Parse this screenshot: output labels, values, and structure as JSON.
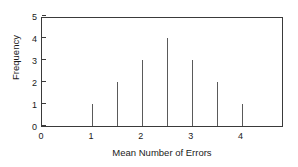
{
  "chart_data": {
    "type": "bar",
    "title": "",
    "subtitle": "",
    "xlabel": "Mean Number of Errors",
    "ylabel": "Frequency",
    "x": [
      1,
      1.5,
      2,
      2.5,
      3,
      3.5,
      4
    ],
    "values": [
      1,
      2,
      3,
      4,
      3,
      2,
      1
    ],
    "categories": [
      "1",
      "1.5",
      "2",
      "2.5",
      "3",
      "3.5",
      "4"
    ],
    "xlim": [
      0,
      4.85
    ],
    "ylim": [
      0,
      5
    ],
    "x_tick_labels": [
      "0",
      "1",
      "2",
      "3",
      "4"
    ],
    "x_tick_values": [
      0,
      1,
      2,
      3,
      4
    ],
    "x_minor_tick_values": [
      1,
      1.5,
      2,
      2.5,
      3,
      3.5,
      4
    ],
    "y_tick_labels": [
      "0",
      "1",
      "2",
      "3",
      "4",
      "5"
    ],
    "y_tick_values": [
      0,
      1,
      2,
      3,
      4,
      5
    ],
    "grid": false,
    "legend": null,
    "legend_position": "none",
    "annotations": [],
    "style": {
      "spike_color": "#5a5a5a",
      "axis_color": "#3a3a3a",
      "text_color": "#1a1a1a",
      "background": "#ffffff",
      "marker": "none",
      "tick_direction": "in"
    }
  }
}
